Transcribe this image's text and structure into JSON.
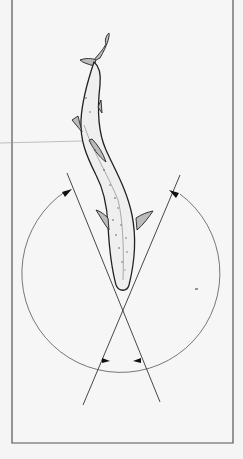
{
  "figure": {
    "colors": {
      "background": "#f5f5f5",
      "frame": "#555555",
      "ink": "#222222"
    },
    "elements": {
      "fish": "fish-illustration",
      "lines": 2,
      "arc_arrows": 4
    }
  }
}
